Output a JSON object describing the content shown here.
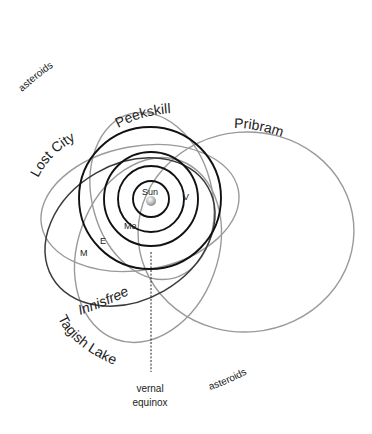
{
  "diagram": {
    "center": {
      "label": "Sun"
    },
    "planets": [
      {
        "key": "mercury",
        "label": "Me"
      },
      {
        "key": "venus",
        "label": "V"
      },
      {
        "key": "earth",
        "label": "E"
      },
      {
        "key": "mars",
        "label": "M"
      }
    ],
    "meteorites": [
      {
        "key": "peekskill",
        "label": "Peekskill"
      },
      {
        "key": "pribram",
        "label": "Pribram"
      },
      {
        "key": "lost_city",
        "label": "Lost City"
      },
      {
        "key": "innisfree",
        "label": "Innisfree"
      },
      {
        "key": "tagish_lake",
        "label": "Tagish Lake"
      }
    ],
    "asteroid_belt_labels": {
      "upper": "asteroids",
      "lower": "asteroids"
    },
    "vernal_equinox": {
      "line1": "vernal",
      "line2": "equinox"
    },
    "colors": {
      "planet_orbit": "#111111",
      "meteor_orbit": "#9a9a9a",
      "meteor_orbit_dark": "#3a3a3a",
      "text": "#222222",
      "background": "#ffffff"
    }
  }
}
